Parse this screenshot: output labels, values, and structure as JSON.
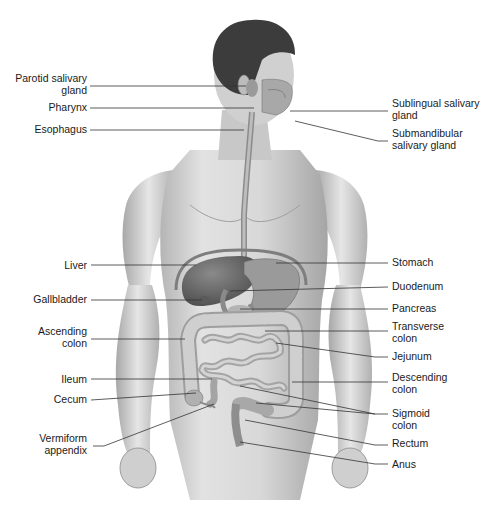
{
  "diagram": {
    "type": "anatomical-illustration",
    "colors": {
      "background": "#ffffff",
      "skin": "#d6d6d6",
      "skin_shadow": "#9a9a9a",
      "hair": "#3a3a3a",
      "organ_dark": "#6e6e6e",
      "organ_mid": "#a8a8a8",
      "intestine": "#c4c4c4",
      "leader_line": "#333333",
      "text": "#1a1a1a"
    },
    "labels_left": [
      {
        "id": "parotid",
        "text": "Parotid salivary\ngland",
        "x": 0,
        "y": 72,
        "w": 87,
        "line": [
          [
            90,
            86
          ],
          [
            246,
            86
          ]
        ]
      },
      {
        "id": "pharynx",
        "text": "Pharynx",
        "x": 0,
        "y": 101,
        "w": 87,
        "line": [
          [
            90,
            108
          ],
          [
            254,
            108
          ]
        ]
      },
      {
        "id": "esophagus",
        "text": "Esophagus",
        "x": 0,
        "y": 123,
        "w": 87,
        "line": [
          [
            90,
            130
          ],
          [
            244,
            130
          ]
        ]
      },
      {
        "id": "liver",
        "text": "Liver",
        "x": 0,
        "y": 259,
        "w": 87,
        "line": [
          [
            91,
            265
          ],
          [
            196,
            265
          ]
        ]
      },
      {
        "id": "gallbladder",
        "text": "Gallbladder",
        "x": 0,
        "y": 293,
        "w": 87,
        "line": [
          [
            91,
            300
          ],
          [
            202,
            300
          ]
        ]
      },
      {
        "id": "ascending-colon",
        "text": "Ascending\ncolon",
        "x": 0,
        "y": 325,
        "w": 87,
        "line": [
          [
            91,
            339
          ],
          [
            185,
            339
          ]
        ]
      },
      {
        "id": "ileum",
        "text": "Ileum",
        "x": 0,
        "y": 373,
        "w": 87,
        "line": [
          [
            91,
            379
          ],
          [
            212,
            379
          ]
        ]
      },
      {
        "id": "cecum",
        "text": "Cecum",
        "x": 0,
        "y": 393,
        "w": 87,
        "line": [
          [
            91,
            400
          ],
          [
            196,
            393
          ]
        ]
      },
      {
        "id": "vermiform-appendix",
        "text": "Vermiform\nappendix",
        "x": 0,
        "y": 432,
        "w": 87,
        "line": [
          [
            93,
            446
          ],
          [
            104,
            446
          ],
          [
            214,
            404
          ]
        ]
      }
    ],
    "labels_right": [
      {
        "id": "sublingual",
        "text": "Sublingual salivary\ngland",
        "x": 392,
        "y": 97,
        "line": [
          [
            290,
            111
          ],
          [
            388,
            111
          ]
        ]
      },
      {
        "id": "submandibular",
        "text": "Submandibular\nsalivary gland",
        "x": 392,
        "y": 127,
        "line": [
          [
            295,
            121
          ],
          [
            378,
            141
          ],
          [
            388,
            141
          ]
        ]
      },
      {
        "id": "stomach",
        "text": "Stomach",
        "x": 392,
        "y": 256,
        "line": [
          [
            276,
            263
          ],
          [
            388,
            263
          ]
        ]
      },
      {
        "id": "duodenum",
        "text": "Duodenum",
        "x": 392,
        "y": 280,
        "line": [
          [
            230,
            291
          ],
          [
            388,
            287
          ]
        ]
      },
      {
        "id": "pancreas",
        "text": "Pancreas",
        "x": 392,
        "y": 302,
        "line": [
          [
            240,
            309
          ],
          [
            388,
            309
          ]
        ]
      },
      {
        "id": "transverse-colon",
        "text": "Transverse\ncolon",
        "x": 392,
        "y": 320,
        "line": [
          [
            265,
            331
          ],
          [
            388,
            331
          ]
        ]
      },
      {
        "id": "jejunum",
        "text": "Jejunum",
        "x": 392,
        "y": 350,
        "line": [
          [
            276,
            343
          ],
          [
            375,
            357
          ],
          [
            388,
            357
          ]
        ]
      },
      {
        "id": "descending-colon",
        "text": "Descending\ncolon",
        "x": 392,
        "y": 371,
        "line": [
          [
            292,
            382
          ],
          [
            388,
            382
          ]
        ]
      },
      {
        "id": "sigmoid-colon",
        "text": "Sigmoid\ncolon",
        "x": 392,
        "y": 407,
        "line": [
          [
            240,
            386
          ],
          [
            375,
            414
          ],
          [
            388,
            414
          ]
        ],
        "line2": [
          [
            256,
            403
          ],
          [
            375,
            414
          ]
        ]
      },
      {
        "id": "rectum",
        "text": "Rectum",
        "x": 392,
        "y": 437,
        "line": [
          [
            245,
            420
          ],
          [
            375,
            445
          ],
          [
            388,
            445
          ]
        ]
      },
      {
        "id": "anus",
        "text": "Anus",
        "x": 392,
        "y": 458,
        "line": [
          [
            240,
            442
          ],
          [
            375,
            464
          ],
          [
            388,
            464
          ]
        ]
      }
    ]
  }
}
